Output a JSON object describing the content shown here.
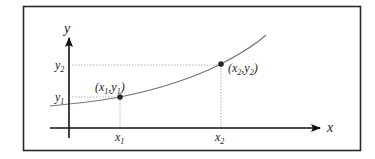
{
  "diagram": {
    "type": "function-graph",
    "axes": {
      "x_label": "x",
      "y_label": "y"
    },
    "points": [
      {
        "name": "point-1",
        "label": "(x1,y1)",
        "x_label": "x1",
        "y_label": "y1"
      },
      {
        "name": "point-2",
        "label": "(x2,y2)",
        "x_label": "x2",
        "y_label": "y2"
      }
    ],
    "colors": {
      "border": "#2a2a2a",
      "axis": "#111111",
      "curve": "#777777",
      "guide": "#aaaaaa",
      "point": "#222222"
    }
  }
}
